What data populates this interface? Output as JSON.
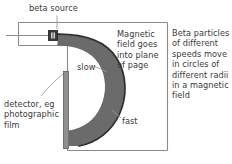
{
  "figure": {
    "background": "#ffffff",
    "width": 232,
    "height": 164
  },
  "labels": {
    "beta_source": "beta source",
    "magnetic_field": "Magnetic\nfield goes\ninto plane\nof page",
    "beta_particles": "Beta particles\nof different\nspeeds move\nin circles of\ndifferent radii\nin a magnetic\nfield",
    "detector": "detector, eg\nphotographic\nfilm",
    "slow": "slow",
    "fast": "fast"
  },
  "colors": {
    "text": "#3b3b3b",
    "frame_line": "#8a8a8a",
    "beam_fill": "#6b6b6b",
    "beam_edge": "#2e2e2e",
    "detector_bar": "#8f8f8f",
    "detector_bar_edge": "#5e5e5e",
    "source_box": "#3a3a3a",
    "leader_line": "#9a9a9a"
  },
  "elements": {
    "chamber_frame": "L-shaped chamber outline",
    "source_box": "beta source capsule",
    "beam_crescent": "fan of beta particle paths curving into crescent",
    "detector_bar": "vertical photographic film strip",
    "leader_beta_source": "vertical leader from beta source label to source box",
    "leader_slow": "leader from slow label to inner beam edge",
    "leader_fast": "leader from fast label to outer beam edge",
    "leader_detector": "curved leader from detector label to film strip"
  }
}
